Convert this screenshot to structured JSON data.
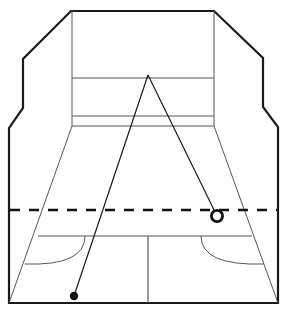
{
  "figure": {
    "background_color": "#ffffff",
    "width": 286,
    "height": 314,
    "line_color": "#1a1a1a",
    "thin_line_color": "#555555",
    "outline_stroke_width": 2.2,
    "thin_stroke_width": 1.0
  },
  "court_outline": {
    "name": "court-outline",
    "description": "Outer beveled boundary of the court viewed in perspective",
    "points": "71,11 214,11 263,58 263,107 278,127 278,303 9,303 9,128 23,108 23,59"
  },
  "back_wall": {
    "name": "back-wall-panel",
    "left_x": 72,
    "right_x": 214,
    "top_y": 11,
    "bottom_y": 126,
    "lines": [
      {
        "name": "out-line",
        "y": 78,
        "x1": 72,
        "x2": 214
      },
      {
        "name": "service-line",
        "y": 116,
        "x1": 72,
        "x2": 214
      },
      {
        "name": "tin-line",
        "y": 126,
        "x1": 72,
        "x2": 214
      }
    ],
    "side_verticals": [
      {
        "name": "left-wall-edge",
        "x": 72,
        "y1": 11,
        "y2": 126
      },
      {
        "name": "right-wall-edge",
        "x": 214,
        "y1": 11,
        "y2": 126
      }
    ]
  },
  "floor": {
    "name": "court-floor",
    "perspective_left": {
      "x1": 72,
      "y1": 126,
      "x2": 9,
      "y2": 303
    },
    "perspective_right": {
      "x1": 214,
      "y1": 126,
      "x2": 278,
      "y2": 303
    },
    "short_line": {
      "name": "short-line-dashed",
      "y": 210,
      "x1": 10,
      "x2": 277,
      "dash": "10 9",
      "stroke_width": 2.4
    },
    "half_court_line": {
      "name": "half-court-line",
      "x": 148,
      "y1": 236,
      "y2": 303
    },
    "service_box_line": {
      "name": "service-box-line",
      "y": 236,
      "x1": 38,
      "x2": 252
    },
    "left_service_arc": {
      "name": "left-service-arc",
      "path": "M 85,236 Q 85,264 25,264"
    },
    "right_service_arc": {
      "name": "right-service-arc",
      "path": "M 201,236 Q 201,264 264,264"
    }
  },
  "trajectory": {
    "name": "ball-trajectory",
    "apex": {
      "x": 148,
      "y": 75
    },
    "incoming_leg": {
      "name": "trajectory-incoming",
      "x1": 74,
      "y1": 296,
      "x2": 148,
      "y2": 75
    },
    "outgoing_leg": {
      "name": "trajectory-outgoing",
      "x1": 148,
      "y1": 75,
      "x2": 217,
      "y2": 216
    }
  },
  "markers": {
    "ball_start": {
      "name": "ball-start-marker",
      "style": "filled-dot",
      "cx": 74,
      "cy": 296,
      "r": 4.2,
      "fill": "#111111"
    },
    "ball_end": {
      "name": "ball-end-marker",
      "style": "open-circle",
      "cx": 217,
      "cy": 216,
      "r": 5.6,
      "stroke_width": 2.8,
      "fill": "#ffffff",
      "stroke": "#111111"
    }
  }
}
